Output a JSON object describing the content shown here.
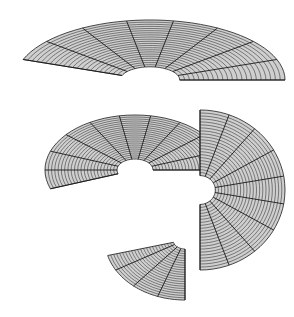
{
  "figure": {
    "background": "#ffffff",
    "stroke_color": "#1a1a1a",
    "fill_light": "#e8e8e8",
    "fill_dark": "#6a6a6a",
    "turns": [
      {
        "name": "top-arc",
        "cx": 150,
        "cy": 80,
        "rx": 135,
        "ry": 60,
        "start_deg": 200,
        "end_deg": 360,
        "inner": 0.22
      },
      {
        "name": "middle-arc",
        "cx": 135,
        "cy": 170,
        "rx": 90,
        "ry": 55,
        "start_deg": 160,
        "end_deg": 360,
        "inner": 0.2
      },
      {
        "name": "right-arc",
        "cx": 200,
        "cy": 190,
        "rx": 85,
        "ry": 80,
        "start_deg": -90,
        "end_deg": 90,
        "inner": 0.18
      },
      {
        "name": "bottom-tail",
        "cx": 185,
        "cy": 240,
        "rx": 80,
        "ry": 60,
        "start_deg": 90,
        "end_deg": 165,
        "inner": 0.15
      }
    ],
    "ring_count": 22,
    "spoke_step_deg": 20
  }
}
